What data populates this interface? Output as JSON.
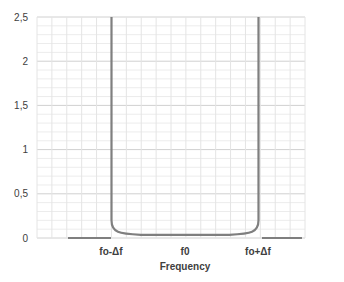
{
  "chart_data": {
    "type": "line",
    "title": "",
    "xlabel": "Frequency",
    "ylabel": "",
    "ylim": [
      0,
      2.5
    ],
    "y_ticks": [
      "0",
      "0,5",
      "1",
      "1,5",
      "2",
      "2,5"
    ],
    "x_tick_labels": [
      "fo-Δf",
      "f0",
      "fo+Δf"
    ],
    "grid": true,
    "legend": null,
    "series": [
      {
        "name": "response",
        "color": "#7f7f7f",
        "x": [
          -1.5,
          -1.0,
          -1.0,
          -0.98,
          -0.95,
          -0.9,
          -0.7,
          -0.4,
          0.0,
          0.4,
          0.7,
          0.9,
          0.95,
          0.98,
          1.0,
          1.0,
          1.5
        ],
        "values": [
          0,
          0,
          2.5,
          0.15,
          0.09,
          0.06,
          0.04,
          0.035,
          0.03,
          0.035,
          0.04,
          0.06,
          0.09,
          0.15,
          2.5,
          0,
          0
        ]
      }
    ]
  },
  "axis": {
    "y_labels": [
      "2,5",
      "2",
      "1,5",
      "1",
      "0,5",
      "0"
    ],
    "x_labels": [
      "fo-Δf",
      "f0",
      "fo+Δf"
    ],
    "x_title": "Frequency"
  }
}
